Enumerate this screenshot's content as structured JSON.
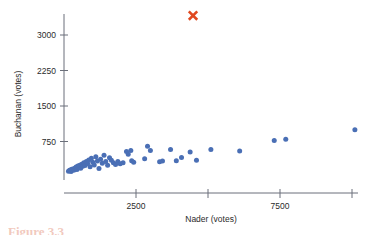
{
  "figure": {
    "caption": "Figure 3.3"
  },
  "chart_data": {
    "type": "scatter",
    "title": "",
    "xlabel": "Nader (votes)",
    "ylabel": "Buchanan (votes)",
    "xlim": [
      0,
      10600
    ],
    "ylim": [
      0,
      3650
    ],
    "grid": false,
    "legend": null,
    "x_ticks": [
      {
        "value": 2500,
        "label": "2500"
      },
      {
        "value": 5000,
        "label": ""
      },
      {
        "value": 7500,
        "label": "7500"
      },
      {
        "value": 10000,
        "label": ""
      }
    ],
    "y_ticks": [
      {
        "value": 750,
        "label": "750"
      },
      {
        "value": 1500,
        "label": "1500"
      },
      {
        "value": 2250,
        "label": "2250"
      },
      {
        "value": 3000,
        "label": "3000"
      }
    ],
    "series": [
      {
        "name": "counties",
        "marker": "circle",
        "color": "#4a6fb5",
        "points": [
          [
            155,
            120
          ],
          [
            185,
            135
          ],
          [
            215,
            150
          ],
          [
            245,
            118
          ],
          [
            270,
            165
          ],
          [
            300,
            140
          ],
          [
            330,
            175
          ],
          [
            360,
            150
          ],
          [
            390,
            190
          ],
          [
            420,
            210
          ],
          [
            450,
            160
          ],
          [
            480,
            230
          ],
          [
            510,
            205
          ],
          [
            545,
            250
          ],
          [
            580,
            185
          ],
          [
            615,
            270
          ],
          [
            650,
            225
          ],
          [
            690,
            300
          ],
          [
            730,
            245
          ],
          [
            775,
            330
          ],
          [
            820,
            285
          ],
          [
            860,
            360
          ],
          [
            905,
            215
          ],
          [
            950,
            395
          ],
          [
            1000,
            310
          ],
          [
            1050,
            255
          ],
          [
            1105,
            430
          ],
          [
            1160,
            340
          ],
          [
            1215,
            180
          ],
          [
            1270,
            375
          ],
          [
            1330,
            290
          ],
          [
            1390,
            460
          ],
          [
            1450,
            330
          ],
          [
            1515,
            250
          ],
          [
            1580,
            405
          ],
          [
            1645,
            355
          ],
          [
            1715,
            300
          ],
          [
            1790,
            265
          ],
          [
            1870,
            330
          ],
          [
            1950,
            280
          ],
          [
            2050,
            300
          ],
          [
            2170,
            540
          ],
          [
            2230,
            480
          ],
          [
            2320,
            560
          ],
          [
            2350,
            345
          ],
          [
            2420,
            310
          ],
          [
            2800,
            385
          ],
          [
            2900,
            650
          ],
          [
            3000,
            560
          ],
          [
            3320,
            320
          ],
          [
            3420,
            340
          ],
          [
            3700,
            580
          ],
          [
            3900,
            345
          ],
          [
            4080,
            410
          ],
          [
            4380,
            530
          ],
          [
            4600,
            355
          ],
          [
            5100,
            580
          ],
          [
            6100,
            550
          ],
          [
            7300,
            770
          ],
          [
            7700,
            800
          ],
          [
            10100,
            1000
          ]
        ]
      },
      {
        "name": "palm-beach-outlier",
        "marker": "x",
        "color": "#e0481f",
        "points": [
          [
            4480,
            3410
          ]
        ]
      }
    ]
  }
}
